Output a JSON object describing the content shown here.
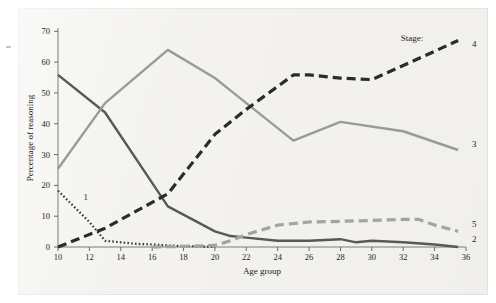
{
  "figure": {
    "background_color": "#f3f2ee",
    "legend_title": "Stage:"
  },
  "chart_data": {
    "type": "line",
    "title": "",
    "xlabel": "Age group",
    "ylabel": "Percentage of reasoning",
    "xlim": [
      10,
      36
    ],
    "ylim": [
      0,
      70
    ],
    "xticks": [
      10,
      12,
      14,
      16,
      18,
      20,
      22,
      24,
      26,
      28,
      30,
      32,
      34,
      36
    ],
    "yticks": [
      0,
      10,
      20,
      30,
      40,
      50,
      60,
      70
    ],
    "grid": false,
    "legend_position": "right-inline-end-of-line",
    "legend_title": "Stage:",
    "series": [
      {
        "name": "1",
        "label": "1",
        "style": "dotted",
        "color": "#3a3a3a",
        "x": [
          10,
          11,
          12,
          13,
          14,
          15,
          16,
          17,
          18,
          19,
          20
        ],
        "values": [
          18,
          13,
          8,
          2,
          1.5,
          1,
          0.8,
          0.5,
          0.3,
          0.2,
          0
        ]
      },
      {
        "name": "2",
        "label": "2",
        "style": "solid",
        "color": "#585858",
        "x": [
          10,
          13,
          17,
          20,
          21,
          22,
          24,
          26,
          28,
          29,
          30,
          32,
          34,
          35.5
        ],
        "values": [
          55,
          43,
          13,
          5,
          3.5,
          3,
          2,
          2,
          2.5,
          1.5,
          2,
          1.5,
          0.8,
          0
        ]
      },
      {
        "name": "3",
        "label": "3",
        "style": "solid",
        "color": "#9a9a97",
        "x": [
          10,
          13,
          17,
          20,
          21,
          25,
          28,
          32,
          35.5
        ],
        "values": [
          25,
          46,
          63,
          54,
          50,
          34,
          40,
          37,
          31
        ]
      },
      {
        "name": "4",
        "label": "4",
        "style": "dashed",
        "color": "#2b2b2b",
        "x": [
          10,
          13,
          17,
          20,
          22,
          25,
          26,
          28,
          30,
          32,
          35.5
        ],
        "values": [
          0,
          6,
          17,
          36,
          44,
          55,
          55,
          54,
          53.5,
          58,
          66
        ]
      },
      {
        "name": "5",
        "label": "5",
        "style": "dashed",
        "color": "#a3a3a0",
        "x": [
          16,
          18,
          20,
          21,
          22,
          24,
          26,
          28,
          30,
          32,
          33,
          34,
          35.5
        ],
        "values": [
          0,
          0.2,
          0.5,
          2,
          4,
          7,
          8,
          8.2,
          8.5,
          8.8,
          8.8,
          7,
          5
        ]
      }
    ]
  }
}
